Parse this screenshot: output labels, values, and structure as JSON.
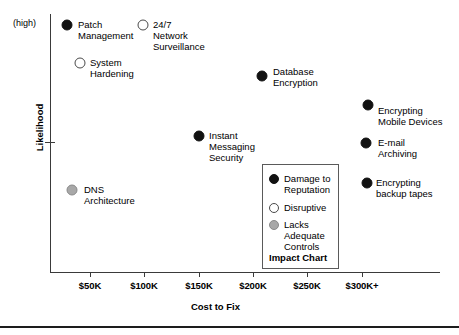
{
  "chart_data": {
    "type": "scatter",
    "title": "Impact Chart",
    "xlabel": "Cost to Fix",
    "ylabel": "Likelihood",
    "y_high_marker": "(high)",
    "grid": false,
    "legend_position": "inside-bottom-right",
    "xticks": [
      "$50K",
      "$100K",
      "$150K",
      "$200K",
      "$250K",
      "$300K+"
    ],
    "categories": [
      {
        "name": "Damage to Reputation",
        "marker": "filled",
        "color": "#121212"
      },
      {
        "name": "Disruptive",
        "marker": "hollow",
        "color": "#ffffff"
      },
      {
        "name": "Lacks Adequate Controls",
        "marker": "gray",
        "color": "#a8a8a8"
      }
    ],
    "points": [
      {
        "label": "Patch\nManagement",
        "marker": "filled",
        "x_cost": "$25K",
        "likelihood": "high",
        "px": 67,
        "py": 25,
        "label_px": 78,
        "label_py": 19,
        "align": "left"
      },
      {
        "label": "24/7\nNetwork\nSurveillance",
        "marker": "hollow",
        "x_cost": "$100K",
        "likelihood": "high",
        "px": 143,
        "py": 25,
        "label_px": 153,
        "label_py": 19,
        "align": "left"
      },
      {
        "label": "System\nHardening",
        "marker": "hollow",
        "x_cost": "$60K",
        "likelihood": "high",
        "px": 80,
        "py": 63,
        "label_px": 90,
        "label_py": 57,
        "align": "left"
      },
      {
        "label": "Database\nEncryption",
        "marker": "filled",
        "x_cost": "$200K",
        "likelihood": "medium-high",
        "px": 262,
        "py": 76,
        "label_px": 273,
        "label_py": 66,
        "align": "left"
      },
      {
        "label": "Encrypting\nMobile Devices",
        "marker": "filled",
        "x_cost": "$300K+",
        "likelihood": "medium",
        "px": 368,
        "py": 105,
        "label_px": 378,
        "label_py": 105,
        "align": "left"
      },
      {
        "label": "Instant\nMessaging\nSecurity",
        "marker": "filled",
        "x_cost": "$150K",
        "likelihood": "medium",
        "px": 199,
        "py": 136,
        "label_px": 209,
        "label_py": 130,
        "align": "left"
      },
      {
        "label": "E-mail\nArchiving",
        "marker": "filled",
        "x_cost": "$300K+",
        "likelihood": "medium-low",
        "px": 366,
        "py": 143,
        "label_px": 378,
        "label_py": 137,
        "align": "left"
      },
      {
        "label": "Encrypting\nbackup tapes",
        "marker": "filled",
        "x_cost": "$300K+",
        "likelihood": "low",
        "px": 367,
        "py": 183,
        "label_px": 376,
        "label_py": 177,
        "align": "left"
      },
      {
        "label": "DNS\nArchitecture",
        "marker": "gray",
        "x_cost": "$40K",
        "likelihood": "low",
        "px": 72,
        "py": 190,
        "label_px": 84,
        "label_py": 184,
        "align": "left"
      }
    ],
    "tick_positions_px": [
      90,
      144,
      199,
      253,
      307,
      362
    ],
    "y_tick_position_px": 142,
    "legend": {
      "title": "Impact Chart",
      "entries": [
        {
          "label": "Damage to\nReputation",
          "marker": "filled",
          "top": 8
        },
        {
          "label": "Disruptive",
          "marker": "hollow",
          "top": 37
        },
        {
          "label": "Lacks\nAdequate\nControls",
          "marker": "gray",
          "top": 54
        }
      ]
    }
  }
}
